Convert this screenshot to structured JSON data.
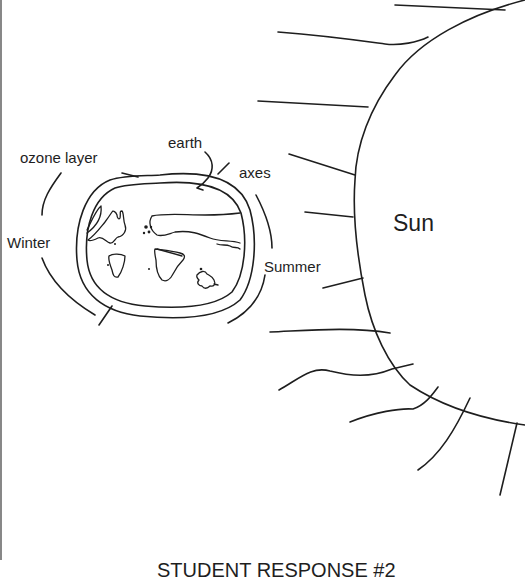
{
  "diagram": {
    "labels": {
      "earth": "earth",
      "ozone_layer": "ozone layer",
      "axes": "axes",
      "winter": "Winter",
      "summer": "Summer",
      "sun": "Sun"
    },
    "caption": "STUDENT RESPONSE #2",
    "colors": {
      "ink": "#1e1e1e",
      "background": "#ffffff",
      "frame": "#555555"
    }
  }
}
